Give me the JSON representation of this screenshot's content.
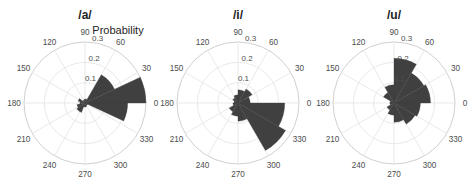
{
  "figure": {
    "rlabel": "Probability",
    "grid_color": "#e3e3e3",
    "bar_color": "#404040",
    "text_color": "#4d4d4d"
  },
  "chart_data": [
    {
      "type": "polar-histogram",
      "title": "/a/",
      "center": [
        85,
        103
      ],
      "radius_px": 61,
      "rlim": [
        0,
        0.3
      ],
      "rticks": [
        "0.1",
        "0.2",
        "0.3"
      ],
      "theta_ticks": [
        "0",
        "30",
        "60",
        "90",
        "120",
        "150",
        "180",
        "210",
        "240",
        "270",
        "300",
        "330"
      ],
      "rlabel_shown": true,
      "bins_deg": [
        [
          0,
          25
        ],
        [
          25,
          60
        ],
        [
          60,
          100
        ],
        [
          100,
          140
        ],
        [
          140,
          165
        ],
        [
          165,
          190
        ],
        [
          190,
          215
        ],
        [
          215,
          250
        ],
        [
          250,
          290
        ],
        [
          290,
          330
        ],
        [
          335,
          360
        ]
      ],
      "values": [
        0.3,
        0.16,
        0.02,
        0.015,
        0.035,
        0.025,
        0.04,
        0.05,
        0.02,
        0.015,
        0.21
      ]
    },
    {
      "type": "polar-histogram",
      "title": "/i/",
      "center": [
        238,
        103
      ],
      "radius_px": 61,
      "rlim": [
        0,
        0.3
      ],
      "rticks": [
        "0.1",
        "0.2",
        "0.3"
      ],
      "theta_ticks": [
        "0",
        "30",
        "60",
        "90",
        "120",
        "150",
        "180",
        "210",
        "240",
        "270",
        "300",
        "330"
      ],
      "rlabel_shown": false,
      "bins_deg": [
        [
          0,
          30
        ],
        [
          30,
          60
        ],
        [
          60,
          90
        ],
        [
          90,
          120
        ],
        [
          120,
          150
        ],
        [
          150,
          180
        ],
        [
          180,
          210
        ],
        [
          210,
          240
        ],
        [
          240,
          270
        ],
        [
          270,
          300
        ],
        [
          300,
          330
        ],
        [
          330,
          360
        ]
      ],
      "values": [
        0.06,
        0.08,
        0.065,
        0.04,
        0.03,
        0.02,
        0.025,
        0.05,
        0.065,
        0.09,
        0.27,
        0.23
      ]
    },
    {
      "type": "polar-histogram",
      "title": "/u/",
      "center": [
        394,
        103
      ],
      "radius_px": 61,
      "rlim": [
        0,
        0.3
      ],
      "rticks": [
        "0.1",
        "0.2",
        "0.3"
      ],
      "theta_ticks": [
        "0",
        "30",
        "60",
        "90",
        "120",
        "150",
        "180",
        "210",
        "240",
        "270",
        "300",
        "330"
      ],
      "rlabel_shown": false,
      "bins_deg": [
        [
          0,
          30
        ],
        [
          30,
          60
        ],
        [
          60,
          90
        ],
        [
          90,
          120
        ],
        [
          120,
          150
        ],
        [
          150,
          180
        ],
        [
          180,
          210
        ],
        [
          210,
          240
        ],
        [
          240,
          270
        ],
        [
          270,
          300
        ],
        [
          300,
          330
        ],
        [
          330,
          360
        ]
      ],
      "values": [
        0.18,
        0.17,
        0.22,
        0.09,
        0.06,
        0.02,
        0.02,
        0.04,
        0.06,
        0.095,
        0.12,
        0.13
      ]
    }
  ]
}
